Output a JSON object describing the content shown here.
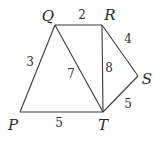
{
  "diagram": {
    "type": "weighted-graph",
    "vertices": [
      {
        "id": "P",
        "label": "P",
        "x": 20,
        "y": 112,
        "lx": 13,
        "ly": 130
      },
      {
        "id": "Q",
        "label": "Q",
        "x": 55,
        "y": 25,
        "lx": 48,
        "ly": 21
      },
      {
        "id": "R",
        "label": "R",
        "x": 102,
        "y": 25,
        "lx": 110,
        "ly": 20
      },
      {
        "id": "S",
        "label": "S",
        "x": 138,
        "y": 76,
        "lx": 147,
        "ly": 84
      },
      {
        "id": "T",
        "label": "T",
        "x": 103,
        "y": 112,
        "lx": 103,
        "ly": 130
      }
    ],
    "edges": [
      {
        "from": "P",
        "to": "Q",
        "weight": "3",
        "lx": 30,
        "ly": 66
      },
      {
        "from": "Q",
        "to": "R",
        "weight": "2",
        "lx": 82,
        "ly": 19
      },
      {
        "from": "R",
        "to": "S",
        "weight": "4",
        "lx": 128,
        "ly": 43
      },
      {
        "from": "Q",
        "to": "T",
        "weight": "7",
        "lx": 71,
        "ly": 78
      },
      {
        "from": "R",
        "to": "T",
        "weight": "8",
        "lx": 109,
        "ly": 72
      },
      {
        "from": "S",
        "to": "T",
        "weight": "5",
        "lx": 128,
        "ly": 108
      },
      {
        "from": "P",
        "to": "T",
        "weight": "5",
        "lx": 59,
        "ly": 127
      }
    ]
  }
}
